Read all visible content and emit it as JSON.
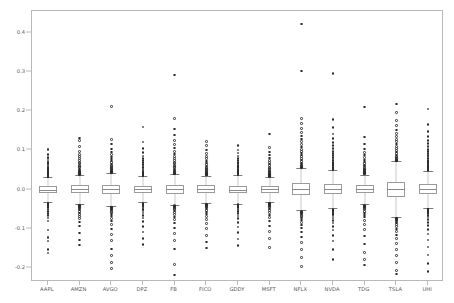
{
  "chart_data": {
    "type": "box",
    "title": "",
    "xlabel": "",
    "ylabel": "",
    "ylim": [
      -0.235,
      0.455
    ],
    "grid": false,
    "legend": false,
    "yticks": [
      0.4,
      0.3,
      0.2,
      0.1,
      0.0,
      -0.1,
      -0.2
    ],
    "ytick_labels": [
      "0.4",
      "0.3",
      "0.2",
      "0.1",
      "0.0",
      "-0.1",
      "-0.2"
    ],
    "categories": [
      "AAPL",
      "AMZN",
      "AVGO",
      "DPZ",
      "FB",
      "FICO",
      "GDDY",
      "MSFT",
      "NFLX",
      "NVDA",
      "TDG",
      "TSLA",
      "UHI"
    ],
    "boxes": [
      {
        "name": "AAPL",
        "q1": -0.0078,
        "median": -0.0002,
        "q3": 0.0082,
        "whisker_low": -0.0315,
        "whisker_high": 0.0318,
        "fliers": [
          0.102,
          0.089,
          0.082,
          0.078,
          0.073,
          0.07,
          0.066,
          0.063,
          0.06,
          0.057,
          0.054,
          0.051,
          0.048,
          0.046,
          0.044,
          0.042,
          0.04,
          0.039,
          0.038,
          0.037,
          0.036,
          0.035,
          0.034,
          0.034,
          0.033,
          0.033,
          0.032,
          0.032,
          -0.034,
          -0.035,
          -0.036,
          -0.037,
          -0.038,
          -0.039,
          -0.04,
          -0.042,
          -0.044,
          -0.046,
          -0.049,
          -0.052,
          -0.056,
          -0.06,
          -0.065,
          -0.072,
          -0.08,
          -0.103,
          -0.122,
          -0.131,
          -0.152,
          -0.161
        ]
      },
      {
        "name": "AMZN",
        "q1": -0.0096,
        "median": 0.0008,
        "q3": 0.0112,
        "whisker_low": -0.0372,
        "whisker_high": 0.0385,
        "fliers": [
          0.132,
          0.126,
          0.11,
          0.098,
          0.09,
          0.084,
          0.079,
          0.074,
          0.07,
          0.066,
          0.062,
          0.059,
          0.056,
          0.053,
          0.05,
          0.048,
          0.046,
          0.044,
          0.043,
          0.042,
          0.041,
          0.04,
          0.04,
          0.039,
          0.039,
          -0.039,
          -0.04,
          -0.041,
          -0.042,
          -0.043,
          -0.045,
          -0.047,
          -0.049,
          -0.052,
          -0.055,
          -0.059,
          -0.063,
          -0.068,
          -0.074,
          -0.082,
          -0.092,
          -0.11,
          -0.128,
          -0.141
        ]
      },
      {
        "name": "AVGO",
        "q1": -0.0107,
        "median": 0.0011,
        "q3": 0.0126,
        "whisker_low": -0.0415,
        "whisker_high": 0.043,
        "fliers": [
          0.212,
          0.128,
          0.116,
          0.104,
          0.096,
          0.089,
          0.083,
          0.078,
          0.073,
          0.069,
          0.065,
          0.062,
          0.059,
          0.056,
          0.054,
          0.052,
          0.05,
          0.048,
          0.047,
          0.046,
          0.045,
          0.044,
          0.044,
          0.043,
          -0.044,
          -0.045,
          -0.046,
          -0.048,
          -0.05,
          -0.052,
          -0.055,
          -0.058,
          -0.062,
          -0.067,
          -0.073,
          -0.08,
          -0.089,
          -0.1,
          -0.114,
          -0.13,
          -0.151,
          -0.168,
          -0.186,
          -0.201
        ]
      },
      {
        "name": "DPZ",
        "q1": -0.0083,
        "median": 0.001,
        "q3": 0.0104,
        "whisker_low": -0.0325,
        "whisker_high": 0.0345,
        "fliers": [
          0.16,
          0.121,
          0.105,
          0.094,
          0.086,
          0.08,
          0.074,
          0.069,
          0.064,
          0.06,
          0.056,
          0.053,
          0.05,
          0.047,
          0.045,
          0.043,
          0.041,
          0.04,
          0.039,
          0.038,
          0.037,
          0.036,
          0.035,
          0.035,
          -0.035,
          -0.036,
          -0.037,
          -0.038,
          -0.04,
          -0.042,
          -0.044,
          -0.047,
          -0.05,
          -0.054,
          -0.059,
          -0.065,
          -0.072,
          -0.081,
          -0.093,
          -0.108,
          -0.125,
          -0.14
        ]
      },
      {
        "name": "FB",
        "q1": -0.0098,
        "median": 0.0007,
        "q3": 0.0113,
        "whisker_low": -0.0382,
        "whisker_high": 0.0392,
        "fliers": [
          0.292,
          0.182,
          0.155,
          0.139,
          0.126,
          0.115,
          0.106,
          0.098,
          0.091,
          0.085,
          0.08,
          0.075,
          0.07,
          0.066,
          0.062,
          0.059,
          0.056,
          0.053,
          0.05,
          0.048,
          0.046,
          0.044,
          0.042,
          0.041,
          0.04,
          -0.04,
          -0.041,
          -0.042,
          -0.044,
          -0.046,
          -0.048,
          -0.051,
          -0.054,
          -0.058,
          -0.063,
          -0.069,
          -0.076,
          -0.085,
          -0.097,
          -0.112,
          -0.13,
          -0.151,
          -0.19,
          -0.217
        ]
      },
      {
        "name": "FICO",
        "q1": -0.0088,
        "median": 0.0013,
        "q3": 0.011,
        "whisker_low": -0.034,
        "whisker_high": 0.0358,
        "fliers": [
          0.123,
          0.112,
          0.101,
          0.092,
          0.085,
          0.079,
          0.073,
          0.068,
          0.064,
          0.06,
          0.057,
          0.054,
          0.051,
          0.049,
          0.047,
          0.045,
          0.043,
          0.042,
          0.041,
          0.04,
          0.039,
          0.038,
          0.037,
          0.037,
          -0.037,
          -0.038,
          -0.039,
          -0.04,
          -0.042,
          -0.044,
          -0.046,
          -0.049,
          -0.053,
          -0.057,
          -0.062,
          -0.068,
          -0.076,
          -0.086,
          -0.099,
          -0.116,
          -0.133,
          -0.148
        ]
      },
      {
        "name": "GDDY",
        "q1": -0.0094,
        "median": 0.0005,
        "q3": 0.0105,
        "whisker_low": -0.0355,
        "whisker_high": 0.0362,
        "fliers": [
          0.112,
          0.101,
          0.093,
          0.086,
          0.08,
          0.075,
          0.07,
          0.066,
          0.062,
          0.059,
          0.056,
          0.053,
          0.051,
          0.049,
          0.047,
          0.045,
          0.044,
          0.043,
          0.042,
          0.041,
          0.04,
          0.039,
          0.038,
          -0.038,
          -0.039,
          -0.04,
          -0.042,
          -0.044,
          -0.046,
          -0.049,
          -0.052,
          -0.056,
          -0.061,
          -0.067,
          -0.074,
          -0.083,
          -0.095,
          -0.109,
          -0.126,
          -0.142
        ]
      },
      {
        "name": "MSFT",
        "q1": -0.0081,
        "median": 0.0009,
        "q3": 0.0099,
        "whisker_low": -0.0318,
        "whisker_high": 0.033,
        "fliers": [
          0.142,
          0.107,
          0.096,
          0.088,
          0.081,
          0.075,
          0.07,
          0.065,
          0.061,
          0.057,
          0.054,
          0.051,
          0.048,
          0.046,
          0.044,
          0.042,
          0.04,
          0.039,
          0.038,
          0.037,
          0.036,
          0.035,
          0.034,
          0.034,
          -0.034,
          -0.035,
          -0.036,
          -0.037,
          -0.039,
          -0.041,
          -0.043,
          -0.046,
          -0.049,
          -0.053,
          -0.058,
          -0.064,
          -0.071,
          -0.08,
          -0.092,
          -0.107,
          -0.124,
          -0.147
        ]
      },
      {
        "name": "NFLX",
        "q1": -0.0135,
        "median": 0.0012,
        "q3": 0.0158,
        "whisker_low": -0.0528,
        "whisker_high": 0.0548,
        "fliers": [
          0.422,
          0.302,
          0.182,
          0.168,
          0.156,
          0.146,
          0.137,
          0.129,
          0.122,
          0.115,
          0.109,
          0.103,
          0.098,
          0.093,
          0.088,
          0.084,
          0.08,
          0.076,
          0.072,
          0.068,
          0.065,
          0.062,
          0.06,
          0.058,
          0.057,
          0.056,
          -0.056,
          -0.057,
          -0.058,
          -0.06,
          -0.062,
          -0.065,
          -0.068,
          -0.072,
          -0.077,
          -0.083,
          -0.09,
          -0.098,
          -0.108,
          -0.12,
          -0.135,
          -0.152,
          -0.173,
          -0.196
        ]
      },
      {
        "name": "NVDA",
        "q1": -0.0122,
        "median": 0.0016,
        "q3": 0.0148,
        "whisker_low": -0.0478,
        "whisker_high": 0.05,
        "fliers": [
          0.296,
          0.179,
          0.158,
          0.142,
          0.13,
          0.12,
          0.112,
          0.105,
          0.098,
          0.092,
          0.087,
          0.082,
          0.078,
          0.074,
          0.07,
          0.067,
          0.064,
          0.061,
          0.058,
          0.056,
          0.054,
          0.053,
          0.052,
          0.051,
          -0.051,
          -0.052,
          -0.053,
          -0.055,
          -0.057,
          -0.06,
          -0.063,
          -0.067,
          -0.072,
          -0.078,
          -0.085,
          -0.093,
          -0.103,
          -0.116,
          -0.131,
          -0.152,
          -0.178
        ]
      },
      {
        "name": "TDG",
        "q1": -0.009,
        "median": 0.0012,
        "q3": 0.011,
        "whisker_low": -0.0352,
        "whisker_high": 0.0368,
        "fliers": [
          0.211,
          0.134,
          0.116,
          0.104,
          0.095,
          0.088,
          0.082,
          0.076,
          0.071,
          0.067,
          0.063,
          0.06,
          0.057,
          0.054,
          0.052,
          0.05,
          0.048,
          0.046,
          0.045,
          0.044,
          0.043,
          0.042,
          0.041,
          0.04,
          -0.04,
          -0.041,
          -0.042,
          -0.044,
          -0.046,
          -0.048,
          -0.051,
          -0.055,
          -0.059,
          -0.064,
          -0.07,
          -0.078,
          -0.088,
          -0.101,
          -0.118,
          -0.138,
          -0.16,
          -0.178,
          -0.192
        ]
      },
      {
        "name": "TSLA",
        "q1": -0.0182,
        "median": 0.0009,
        "q3": 0.0204,
        "whisker_low": -0.07,
        "whisker_high": 0.0722,
        "fliers": [
          0.218,
          0.196,
          0.176,
          0.163,
          0.152,
          0.143,
          0.135,
          0.128,
          0.122,
          0.116,
          0.11,
          0.105,
          0.1,
          0.096,
          0.092,
          0.088,
          0.085,
          0.082,
          0.079,
          0.077,
          0.075,
          0.074,
          0.073,
          -0.073,
          -0.074,
          -0.075,
          -0.077,
          -0.079,
          -0.082,
          -0.085,
          -0.089,
          -0.094,
          -0.1,
          -0.107,
          -0.115,
          -0.125,
          -0.137,
          -0.152,
          -0.168,
          -0.185,
          -0.205,
          -0.215
        ]
      },
      {
        "name": "UHI",
        "q1": -0.0118,
        "median": 0.0007,
        "q3": 0.0133,
        "whisker_low": -0.0462,
        "whisker_high": 0.0478,
        "fliers": [
          0.205,
          0.166,
          0.148,
          0.135,
          0.125,
          0.117,
          0.11,
          0.103,
          0.097,
          0.092,
          0.087,
          0.083,
          0.079,
          0.075,
          0.072,
          0.069,
          0.066,
          0.063,
          0.061,
          0.059,
          0.057,
          0.055,
          0.054,
          0.053,
          0.052,
          0.051,
          0.05,
          0.049,
          -0.049,
          -0.05,
          -0.051,
          -0.053,
          -0.055,
          -0.058,
          -0.061,
          -0.065,
          -0.07,
          -0.076,
          -0.083,
          -0.091,
          -0.101,
          -0.113,
          -0.128,
          -0.146,
          -0.166,
          -0.188,
          -0.208
        ]
      }
    ]
  }
}
